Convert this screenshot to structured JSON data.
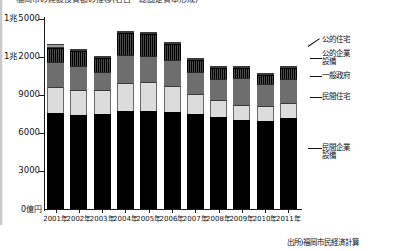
{
  "title": "福岡市の建設投資額の推移(名目・総固定資本形成)",
  "axis": {
    "y_ticks": [
      "1兆5000",
      "1兆2000",
      "9000",
      "6000",
      "3000"
    ],
    "y_zero_label": "0億円",
    "y_values": [
      15000,
      12000,
      9000,
      6000,
      3000
    ],
    "ymax": 15000,
    "ymin": 0
  },
  "legend": {
    "koteki_jutaku": "公的住宅",
    "koteki_kigyo_1": "公的企業",
    "koteki_kigyo_2": "設備",
    "ippan_seifu": "一般政府",
    "minkan_jutaku": "民間住宅",
    "minkan_kigyo_1": "民間企業",
    "minkan_kigyo_2": "設備"
  },
  "source": "出所)福岡市民経済計算",
  "chart_data": {
    "type": "bar",
    "subtype": "stacked",
    "title": "福岡市の建設投資額の推移",
    "xlabel": "",
    "ylabel": "0億円",
    "ylim": [
      0,
      15000
    ],
    "yticks": [
      0,
      3000,
      6000,
      9000,
      12000,
      15000
    ],
    "ytick_labels": [
      "0億円",
      "3000",
      "6000",
      "9000",
      "1兆2000",
      "1兆5000"
    ],
    "grid": false,
    "legend_position": "right",
    "categories": [
      "2001年",
      "2002年",
      "2003年",
      "2004年",
      "2005年",
      "2006年",
      "2007年",
      "2008年",
      "2009年",
      "2010年",
      "2011年"
    ],
    "series": [
      {
        "name": "民間企業設備",
        "color": "#000000",
        "values": [
          7600,
          7450,
          7500,
          7700,
          7700,
          7650,
          7500,
          7250,
          7000,
          6950,
          7150
        ]
      },
      {
        "name": "民間住宅",
        "color": "#dcdcdc",
        "values": [
          2000,
          1950,
          1900,
          2250,
          2300,
          2050,
          1600,
          1350,
          1200,
          1150,
          1250
        ]
      },
      {
        "name": "一般政府",
        "color": "#6e6e6e",
        "values": [
          2000,
          1900,
          1450,
          2200,
          2100,
          2050,
          1700,
          1650,
          2150,
          1750,
          1900
        ]
      },
      {
        "name": "公的企業設備",
        "color": "#151515",
        "values": [
          1150,
          1150,
          1100,
          1750,
          1700,
          1250,
          1000,
          850,
          800,
          700,
          800
        ]
      },
      {
        "name": "公的住宅",
        "color": "#9a9a9a",
        "values": [
          250,
          200,
          150,
          150,
          150,
          150,
          120,
          100,
          100,
          100,
          100
        ]
      }
    ],
    "totals": [
      13000,
      12650,
      12100,
      14050,
      13950,
      13150,
      11920,
      11200,
      11250,
      10650,
      11200
    ]
  }
}
